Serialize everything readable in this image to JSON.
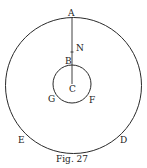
{
  "figure": {
    "caption": "Fig. 27",
    "labels": {
      "A": "A",
      "N": "N",
      "B": "B",
      "C": "C",
      "G": "G",
      "F": "F",
      "E": "E",
      "D": "D"
    }
  }
}
